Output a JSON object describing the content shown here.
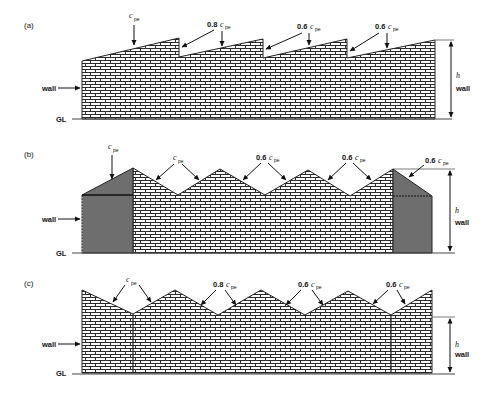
{
  "figure": {
    "panels": [
      {
        "id": "a",
        "label": "(a)",
        "roof_type": "sawtooth",
        "annotations": [
          {
            "coef": "",
            "symbol": "c",
            "subscript": "pe"
          },
          {
            "coef": "0.8",
            "symbol": "c",
            "subscript": "pe"
          },
          {
            "coef": "0.6",
            "symbol": "c",
            "subscript": "pe"
          },
          {
            "coef": "0.6",
            "symbol": "c",
            "subscript": "pe"
          }
        ],
        "wall_label": "wall",
        "ground_label": "GL",
        "height_label": "h",
        "height_sublabel": "wall"
      },
      {
        "id": "b",
        "label": "(b)",
        "roof_type": "multi-span pitched with shaded end bays",
        "annotations": [
          {
            "coef": "",
            "symbol": "c",
            "subscript": "pe"
          },
          {
            "coef": "",
            "symbol": "c",
            "subscript": "pe"
          },
          {
            "coef": "0.6",
            "symbol": "c",
            "subscript": "pe"
          },
          {
            "coef": "0.6",
            "symbol": "c",
            "subscript": "pe"
          },
          {
            "coef": "0.6",
            "symbol": "c",
            "subscript": "pe"
          }
        ],
        "wall_label": "wall",
        "ground_label": "GL",
        "height_label": "h",
        "height_sublabel": "wall"
      },
      {
        "id": "c",
        "label": "(c)",
        "roof_type": "multi-span pitched",
        "annotations": [
          {
            "coef": "",
            "symbol": "c",
            "subscript": "pe"
          },
          {
            "coef": "0.8",
            "symbol": "c",
            "subscript": "pe"
          },
          {
            "coef": "0.6",
            "symbol": "c",
            "subscript": "pe"
          },
          {
            "coef": "0.6",
            "symbol": "c",
            "subscript": "pe"
          }
        ],
        "wall_label": "wall",
        "ground_label": "GL",
        "height_label": "h",
        "height_sublabel": "wall"
      }
    ],
    "colors": {
      "line": "#222222",
      "brick_fill": "#ffffff",
      "mortar": "#333333",
      "shaded_bay": "#6e6e6e"
    }
  }
}
